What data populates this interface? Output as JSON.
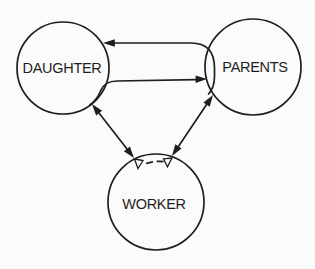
{
  "canvas": {
    "background_color": "#fbfbfb",
    "ink_color": "#1e1e1e"
  },
  "figure": {
    "nodes": [
      {
        "id": "daughter",
        "label": "DAUGHTER"
      },
      {
        "id": "parents",
        "label": "PARENTS"
      },
      {
        "id": "worker",
        "label": "WORKER"
      }
    ],
    "edges": [
      {
        "id": "parents-to-daughter",
        "from": "parents",
        "to": "daughter",
        "line": "solid",
        "heads": "single-arrow-at-daughter"
      },
      {
        "id": "daughter-to-parents",
        "from": "daughter",
        "to": "parents",
        "line": "solid",
        "heads": "single-arrow-at-parents"
      },
      {
        "id": "daughter-worker",
        "from": "daughter",
        "to": "worker",
        "line": "solid",
        "heads": "arrows-both-ends"
      },
      {
        "id": "parents-worker",
        "from": "parents",
        "to": "worker",
        "line": "solid",
        "heads": "arrows-both-ends"
      },
      {
        "id": "worker-top-boundary",
        "at": "worker-top",
        "line": "dashed",
        "heads": "open-arrowheads-both-ends"
      }
    ]
  }
}
